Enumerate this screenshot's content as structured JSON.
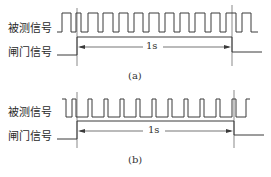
{
  "panels": [
    {
      "id": "a",
      "caption": "(a)",
      "measured_signal_label": "被测信号",
      "gate_signal_label": "闸门信号",
      "duration_label": "1s"
    },
    {
      "id": "b",
      "caption": "(b)",
      "measured_signal_label": "被测信号",
      "gate_signal_label": "闸门信号",
      "duration_label": "1s"
    }
  ],
  "colors": {
    "line": "#3a3a3a",
    "text": "#2a2a2a"
  }
}
